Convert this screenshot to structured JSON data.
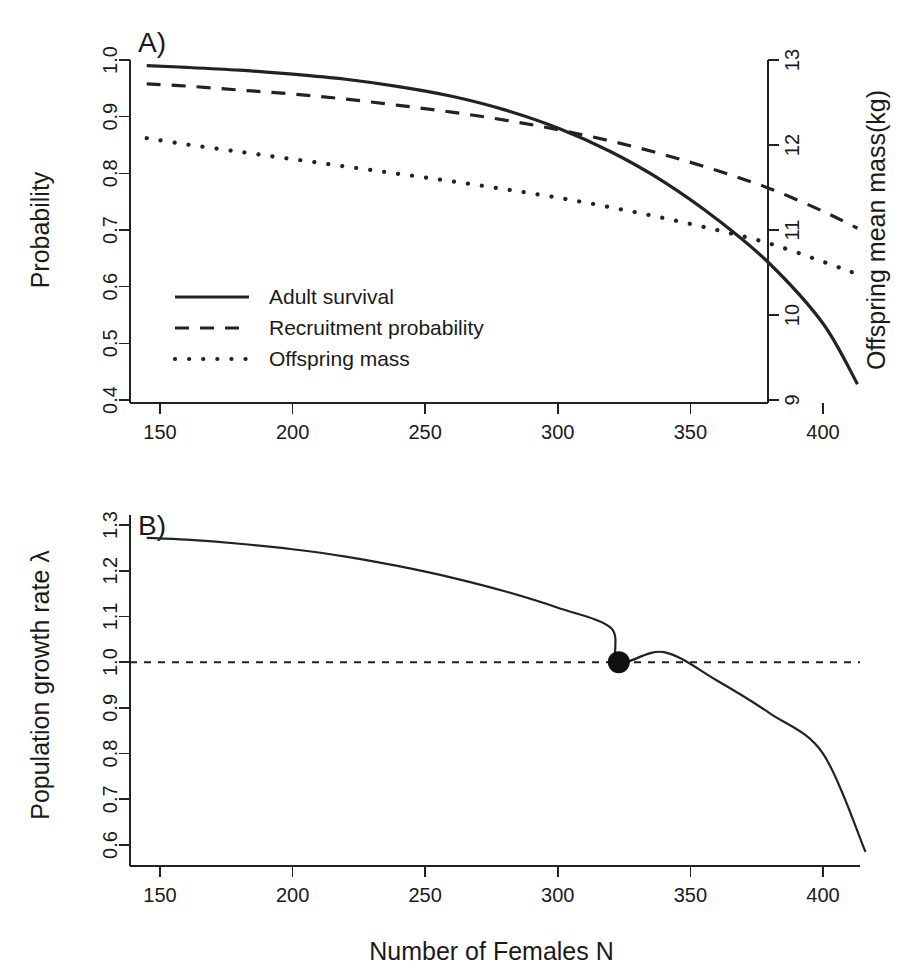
{
  "figure": {
    "background": "#ffffff",
    "ink": "#222222",
    "width": 902,
    "height": 977
  },
  "panels": [
    {
      "id": "panel-a",
      "label": "A)",
      "y_left": {
        "title": "Probability",
        "ticks": [
          "1.0",
          "0.9",
          "0.8",
          "0.7",
          "0.6",
          "0.5",
          "0.4"
        ],
        "range": [
          0.4,
          1.0
        ]
      },
      "y_right": {
        "title": "Offspring mean mass(kg)",
        "ticks": [
          "13",
          "12",
          "11",
          "10",
          "9"
        ],
        "range": [
          9,
          13
        ]
      },
      "x_axis": {
        "title": "",
        "ticks": [
          "150",
          "200",
          "250",
          "300",
          "350",
          "400"
        ],
        "range": [
          140,
          420
        ]
      },
      "legend": [
        {
          "label": "Adult survival",
          "style": "solid"
        },
        {
          "label": "Recruitment probability",
          "style": "dashed"
        },
        {
          "label": "Offspring mass",
          "style": "dotted"
        }
      ]
    },
    {
      "id": "panel-b",
      "label": "B)",
      "y_left": {
        "title": "Population growth rate λ",
        "ticks": [
          "1.3",
          "1.2",
          "1.1",
          "1.0",
          "0.9",
          "0.8",
          "0.7",
          "0.6"
        ],
        "range": [
          0.6,
          1.3
        ]
      },
      "x_axis": {
        "title": "Number of Females N",
        "ticks": [
          "150",
          "200",
          "250",
          "300",
          "350",
          "400"
        ],
        "range": [
          140,
          420
        ]
      },
      "reference_line": {
        "value": 1.0,
        "style": "dashed"
      },
      "equilibrium_point": {
        "x": 323,
        "y": 1.0
      }
    }
  ],
  "chart_data": [
    {
      "type": "line",
      "id": "panel-a",
      "title": "A)",
      "xlabel": "",
      "ylabel": "Probability",
      "y2label": "Offspring mean mass(kg)",
      "xlim": [
        140,
        420
      ],
      "ylim": [
        0.4,
        1.0
      ],
      "y2lim": [
        9,
        13
      ],
      "xticks": [
        150,
        200,
        250,
        300,
        350,
        400
      ],
      "yticks": [
        0.4,
        0.5,
        0.6,
        0.7,
        0.8,
        0.9,
        1.0
      ],
      "y2ticks": [
        9,
        10,
        11,
        12,
        13
      ],
      "grid": false,
      "legend_position": "center-left",
      "x": [
        145,
        160,
        180,
        200,
        220,
        240,
        260,
        280,
        300,
        320,
        340,
        360,
        380,
        400,
        413
      ],
      "series": [
        {
          "name": "Adult survival",
          "style": "solid",
          "axis": "left",
          "values": [
            0.99,
            0.987,
            0.982,
            0.975,
            0.966,
            0.953,
            0.936,
            0.912,
            0.88,
            0.838,
            0.785,
            0.719,
            0.64,
            0.535,
            0.428
          ]
        },
        {
          "name": "Recruitment probability",
          "style": "dashed",
          "axis": "left",
          "values": [
            0.958,
            0.954,
            0.947,
            0.94,
            0.931,
            0.92,
            0.908,
            0.894,
            0.877,
            0.857,
            0.833,
            0.805,
            0.773,
            0.733,
            0.703
          ]
        },
        {
          "name": "Offspring mass",
          "style": "dotted",
          "axis": "right",
          "values": [
            0.862,
            0.851,
            0.838,
            0.825,
            0.812,
            0.799,
            0.786,
            0.772,
            0.757,
            0.74,
            0.721,
            0.7,
            0.676,
            0.644,
            0.622
          ]
        }
      ]
    },
    {
      "type": "line",
      "id": "panel-b",
      "title": "B)",
      "xlabel": "Number of Females N",
      "ylabel": "Population growth rate λ",
      "xlim": [
        140,
        420
      ],
      "ylim": [
        0.55,
        1.3
      ],
      "xticks": [
        150,
        200,
        250,
        300,
        350,
        400
      ],
      "yticks": [
        0.6,
        0.7,
        0.8,
        0.9,
        1.0,
        1.1,
        1.2,
        1.3
      ],
      "grid": false,
      "legend_position": "none",
      "x": [
        145,
        160,
        180,
        200,
        220,
        240,
        260,
        280,
        300,
        320,
        323,
        340,
        360,
        380,
        400,
        416
      ],
      "series": [
        {
          "name": "Population growth rate",
          "style": "solid-thin",
          "values": [
            1.272,
            1.268,
            1.259,
            1.247,
            1.231,
            1.21,
            1.185,
            1.155,
            1.119,
            1.075,
            1.0,
            1.022,
            0.96,
            0.888,
            0.8,
            0.585
          ]
        }
      ],
      "annotations": [
        {
          "type": "hline",
          "y": 1.0,
          "style": "dashed",
          "label": ""
        },
        {
          "type": "point",
          "x": 323,
          "y": 1.0,
          "label": ""
        }
      ]
    }
  ]
}
